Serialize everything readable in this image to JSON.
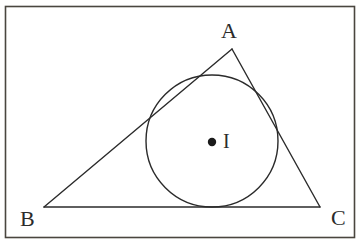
{
  "figure": {
    "name": "triangle-with-incircle",
    "background_color": "#ffffff",
    "stroke_color": "#2b2b2b",
    "frame": {
      "name": "image-border",
      "x": 5,
      "y": 6,
      "width": 350,
      "height": 232,
      "stroke_color": "#4a463f",
      "stroke_width": 1.6
    },
    "triangle": {
      "name": "triangle-ABC",
      "stroke_width": 1.4,
      "fill": "none",
      "vertices": [
        {
          "id": "A",
          "label": "A",
          "x": 232,
          "y": 49
        },
        {
          "id": "B",
          "label": "B",
          "x": 44,
          "y": 207
        },
        {
          "id": "C",
          "label": "C",
          "x": 320,
          "y": 207
        }
      ],
      "sides": [
        {
          "id": "AB",
          "from": "A",
          "to": "B"
        },
        {
          "id": "BC",
          "from": "B",
          "to": "C"
        },
        {
          "id": "CA",
          "from": "C",
          "to": "A"
        }
      ]
    },
    "incircle": {
      "name": "inscribed-circle",
      "center_x": 212,
      "center_y": 141,
      "radius": 66,
      "stroke_width": 1.4,
      "fill": "none"
    },
    "incenter": {
      "name": "incenter-point",
      "label": "I",
      "x": 212,
      "y": 142,
      "dot_radius": 4.2,
      "fill": "#1a1a1a"
    },
    "labels": {
      "A": "A",
      "B": "B",
      "C": "C",
      "I": "I"
    }
  }
}
